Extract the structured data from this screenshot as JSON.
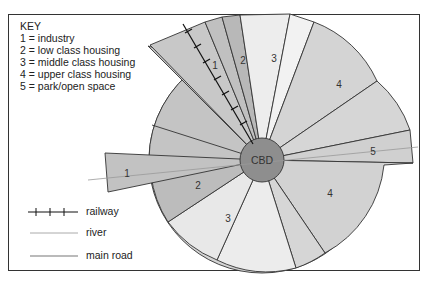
{
  "key": {
    "title": "KEY",
    "items": [
      {
        "code": "1",
        "label": "1 = industry"
      },
      {
        "code": "2",
        "label": "2 = low class housing"
      },
      {
        "code": "3",
        "label": "3 = middle class housing"
      },
      {
        "code": "4",
        "label": "4 = upper class housing"
      },
      {
        "code": "5",
        "label": "5 = park/open space"
      }
    ]
  },
  "center_label": "CBD",
  "legend": [
    {
      "symbol": "railway-line",
      "label": "railway"
    },
    {
      "symbol": "river-line",
      "label": "river"
    },
    {
      "symbol": "main-road-line",
      "label": "main road"
    }
  ],
  "sector_labels": {
    "s1": "1",
    "s2_top": "2",
    "s3_top": "3",
    "s4_top": "4",
    "s5": "5",
    "s4_bottom": "4",
    "s3_bottom": "3",
    "s2_bottom": "2",
    "s1_rail": "1"
  },
  "colors": {
    "dark_gray": "#b4b4b4",
    "mid_gray": "#c8c8c8",
    "light_gray": "#d8d8d8",
    "pale": "#ececec",
    "cbd": "#8e8e8e",
    "outline": "#333333"
  }
}
